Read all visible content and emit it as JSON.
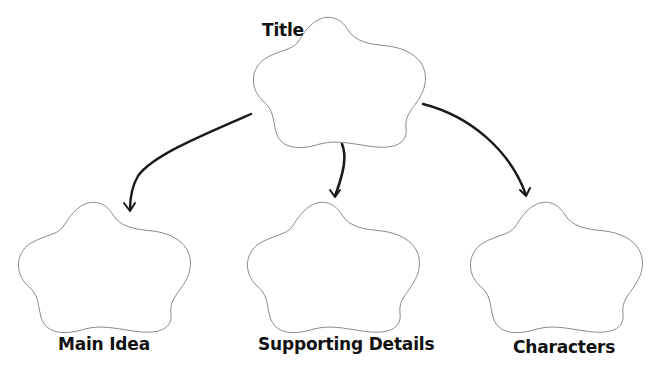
{
  "diagram": {
    "type": "graphic-organizer",
    "nodes": [
      {
        "id": "title",
        "label": "Title",
        "shape": "cloud"
      },
      {
        "id": "main_idea",
        "label": "Main Idea",
        "shape": "cloud"
      },
      {
        "id": "supporting_details",
        "label": "Supporting Details",
        "shape": "cloud"
      },
      {
        "id": "characters",
        "label": "Characters",
        "shape": "cloud"
      }
    ],
    "edges": [
      {
        "from": "title",
        "to": "main_idea"
      },
      {
        "from": "title",
        "to": "supporting_details"
      },
      {
        "from": "title",
        "to": "characters"
      }
    ],
    "colors": {
      "outline": "#8a8a8a",
      "arrow": "#1a1a1a",
      "text": "#111111",
      "background": "#ffffff"
    }
  }
}
